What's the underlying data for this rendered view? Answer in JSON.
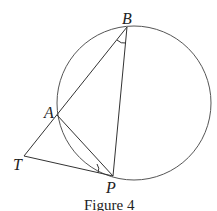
{
  "figure": {
    "caption": "Figure 4",
    "points": {
      "B": "B",
      "A": "A",
      "T": "T",
      "P": "P"
    }
  }
}
